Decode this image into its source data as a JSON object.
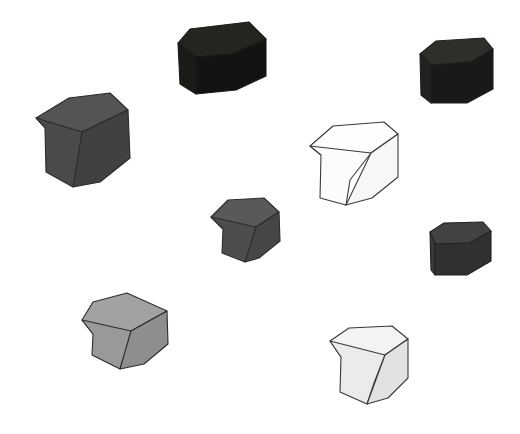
{
  "scene": {
    "title": "Grayscale Cubes Scene",
    "width": 520,
    "height": 434,
    "background_color": "#ffffff",
    "outline_color": "#333333",
    "object_count": 8,
    "object_kind": "cube",
    "projection": "isometric-like three-quarter view",
    "description": "Eight shaded cubes of varying gray lightness scattered across a white background"
  },
  "chart_data": {
    "type": "scatter",
    "xlabel": "",
    "ylabel": "",
    "xlim": [
      0,
      520
    ],
    "ylim": [
      0,
      434
    ],
    "grid": false,
    "legend": "none",
    "categories": [
      "top-middle-black",
      "top-right-black",
      "left-dark-gray",
      "center-white",
      "middle-dark-gray",
      "right-dark-gray",
      "bottom-left-light-gray",
      "bottom-right-near-white"
    ],
    "values": [
      10,
      13,
      33,
      100,
      35,
      23,
      62,
      95
    ],
    "series": [
      {
        "name": "lightness_percent",
        "values": [
          10,
          13,
          33,
          100,
          35,
          23,
          62,
          95
        ]
      },
      {
        "name": "x_center",
        "values": [
          221,
          452,
          86,
          351,
          245,
          465,
          122,
          372
        ]
      },
      {
        "name": "y_center",
        "values": [
          58,
          72,
          143,
          156,
          235,
          255,
          334,
          363
        ]
      }
    ]
  },
  "cubes": [
    {
      "id": "cube-top-middle",
      "label": "Top middle cube",
      "tone_name": "black",
      "lightness_percent": 10,
      "top_color": "#26241f",
      "left_color": "#1b1a17",
      "right_color": "#141311",
      "outline_color": "#1a1a18",
      "top_face": "178,43 190,29 249,22 266,39 232,54 196,57",
      "left_face": "178,43 196,57 196,94 180,84",
      "right_face": "196,57 232,54 266,39 266,76 236,90 196,94"
    },
    {
      "id": "cube-top-right",
      "label": "Top right cube",
      "tone_name": "near black",
      "lightness_percent": 13,
      "top_color": "#302e2b",
      "left_color": "#232120",
      "right_color": "#1a1918",
      "outline_color": "#1f1e1d",
      "top_face": "420,54 436,41 484,38 493,49 471,62 431,65",
      "left_face": "420,54 431,65 431,103 421,95",
      "right_face": "431,65 471,62 493,49 493,89 467,103 431,103"
    },
    {
      "id": "cube-left-large",
      "label": "Left large cube",
      "tone_name": "dark gray",
      "lightness_percent": 33,
      "top_color": "#565452",
      "left_color": "#4c4a48",
      "right_color": "#434140",
      "outline_color": "#2b2a29",
      "top_face": "36,118 69,98 110,93 128,110 82,132 45,128",
      "left_face": "36,118 45,128 46,172 73,187 81,168 82,132",
      "right_face": "82,132 128,110 130,158 100,182 73,187"
    },
    {
      "id": "cube-center-white",
      "label": "Center white cube",
      "tone_name": "white",
      "lightness_percent": 100,
      "top_color": "#fefefe",
      "left_color": "#fcfcfc",
      "right_color": "#f7f7f7",
      "outline_color": "#3a3a3a",
      "top_face": "310,146 333,126 384,122 398,134 371,153 321,155",
      "left_face": "310,146 321,155 320,198 346,205 350,180 371,153",
      "right_face": "371,153 398,134 398,177 372,198 346,205"
    },
    {
      "id": "cube-middle-small",
      "label": "Middle small cube",
      "tone_name": "medium dark gray",
      "lightness_percent": 35,
      "top_color": "#5b5957",
      "left_color": "#4f4d4c",
      "right_color": "#474644",
      "outline_color": "#2c2b2a",
      "top_face": "211,217 228,200 264,198 279,212 256,227 223,229",
      "left_face": "211,217 223,229 222,253 245,262 252,247 256,227",
      "right_face": "256,227 279,212 280,241 259,258 245,262"
    },
    {
      "id": "cube-right-small",
      "label": "Right small cube",
      "tone_name": "dark gray",
      "lightness_percent": 23,
      "top_color": "#434240",
      "left_color": "#393837",
      "right_color": "#313030",
      "outline_color": "#242322",
      "top_face": "430,232 444,223 483,222 491,231 470,243 435,244",
      "left_face": "430,232 435,244 435,275 431,270",
      "right_face": "435,244 470,243 491,231 491,261 467,275 435,275"
    },
    {
      "id": "cube-bottom-left",
      "label": "Bottom left cube",
      "tone_name": "light gray",
      "lightness_percent": 62,
      "top_color": "#a3a2a0",
      "left_color": "#9a9997",
      "right_color": "#8f8e8c",
      "outline_color": "#2e2d2c",
      "top_face": "82,320 93,302 127,293 167,311 131,331 93,334",
      "left_face": "82,320 93,334 92,355 120,369 126,351 131,331",
      "right_face": "131,331 167,311 168,344 144,364 120,369"
    },
    {
      "id": "cube-bottom-right",
      "label": "Bottom right cube",
      "tone_name": "near white",
      "lightness_percent": 95,
      "top_color": "#f3f3f2",
      "left_color": "#ebebea",
      "right_color": "#e2e2e1",
      "outline_color": "#3a3938",
      "top_face": "330,341 349,328 392,326 408,339 385,355 341,357",
      "left_face": "330,341 341,357 340,392 367,404 374,383 385,355",
      "right_face": "385,355 408,339 408,378 388,398 367,404"
    }
  ]
}
